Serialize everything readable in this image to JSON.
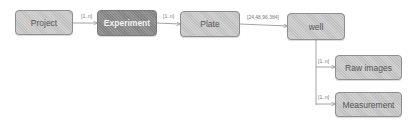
{
  "diagram": {
    "nodes": [
      {
        "id": "project",
        "label": "Project"
      },
      {
        "id": "experiment",
        "label": "Experiment",
        "highlighted": true
      },
      {
        "id": "plate",
        "label": "Plate"
      },
      {
        "id": "well",
        "label": "well"
      },
      {
        "id": "raw_images",
        "label": "Raw images"
      },
      {
        "id": "measurement",
        "label": "Measurement"
      }
    ],
    "edges": [
      {
        "from": "project",
        "to": "experiment",
        "label": "[1..n]"
      },
      {
        "from": "experiment",
        "to": "plate",
        "label": "[1..n]"
      },
      {
        "from": "plate",
        "to": "well",
        "label": "[24,48,96,384]"
      },
      {
        "from": "well",
        "to": "raw_images",
        "label": "[1..n]"
      },
      {
        "from": "well",
        "to": "measurement",
        "label": "[1..n]"
      }
    ],
    "colors": {
      "node_fill": "#c8c8c8",
      "highlight_fill": "#8a8a8a",
      "edge": "#8c8c8c"
    }
  }
}
